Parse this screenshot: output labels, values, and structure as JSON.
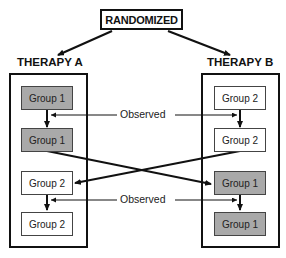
{
  "diagram": {
    "root": {
      "label": "RANDOMIZED"
    },
    "arms": [
      {
        "label": "THERAPY A",
        "groups": [
          {
            "label": "Group 1",
            "shaded": true
          },
          {
            "label": "Group 1",
            "shaded": true
          },
          {
            "label": "Group 2",
            "shaded": false
          },
          {
            "label": "Group 2",
            "shaded": false
          }
        ]
      },
      {
        "label": "THERAPY B",
        "groups": [
          {
            "label": "Group 2",
            "shaded": false
          },
          {
            "label": "Group 2",
            "shaded": false
          },
          {
            "label": "Group 1",
            "shaded": true
          },
          {
            "label": "Group 1",
            "shaded": true
          }
        ]
      }
    ],
    "annotations": [
      {
        "label": "Observed"
      },
      {
        "label": "Observed"
      }
    ],
    "colors": {
      "line": "#111111",
      "shaded_group": "#a9a9a9",
      "unshaded_group": "#ffffff"
    }
  }
}
